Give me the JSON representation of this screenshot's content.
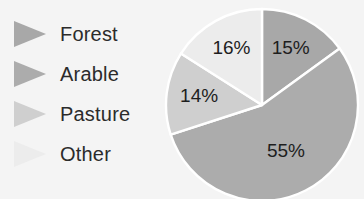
{
  "chart_data": {
    "type": "pie",
    "title": "",
    "categories": [
      "Forest",
      "Arable",
      "Pasture",
      "Other"
    ],
    "values": [
      15,
      55,
      14,
      16
    ],
    "value_labels": [
      "15%",
      "55%",
      "14%",
      "16%"
    ],
    "unit": "%",
    "legend_position": "left",
    "grid": false,
    "start_angle_deg": 0,
    "direction": "clockwise",
    "colors": [
      "#a8a8a8",
      "#acacac",
      "#cfcfcf",
      "#ececec"
    ],
    "slice_border_color": "#ffffff",
    "background": "#f4f4f4",
    "text_color": "#1e1e1e"
  },
  "legend": {
    "items": [
      {
        "label": "Forest",
        "color": "#a8a8a8",
        "value_label": "15%"
      },
      {
        "label": "Arable",
        "color": "#acacac",
        "value_label": "55%"
      },
      {
        "label": "Pasture",
        "color": "#cfcfcf",
        "value_label": "14%"
      },
      {
        "label": "Other",
        "color": "#ececec",
        "value_label": "16%"
      }
    ]
  },
  "pie": {
    "slices": [
      {
        "name": "Forest",
        "label": "15%",
        "color": "#a8a8a8"
      },
      {
        "name": "Arable",
        "label": "55%",
        "color": "#acacac"
      },
      {
        "name": "Pasture",
        "label": "14%",
        "color": "#cfcfcf"
      },
      {
        "name": "Other",
        "label": "16%",
        "color": "#ececec"
      }
    ]
  }
}
